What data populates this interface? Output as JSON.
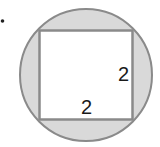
{
  "diagram": {
    "bullet": "•",
    "square": {
      "side_label_right": "2",
      "side_label_bottom": "2"
    },
    "colors": {
      "shade": "#d9d9d9",
      "stroke": "#8a8a8a",
      "square_fill": "#ffffff",
      "text": "#1a1a1a"
    }
  }
}
